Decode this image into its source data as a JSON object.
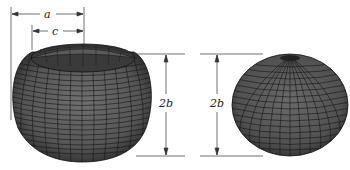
{
  "figure": {
    "left_shape": {
      "name": "torus surface",
      "dimensions": {
        "outer_radius_label": "a",
        "inner_radius_label": "c",
        "height_label": "2b"
      }
    },
    "right_shape": {
      "name": "spheroid surface",
      "dimensions": {
        "height_label": "2b"
      }
    }
  },
  "colors": {
    "surface_fill": "#555555",
    "mesh_lines": "#111111",
    "dimension_lines": "#333333",
    "background": "#ffffff"
  }
}
